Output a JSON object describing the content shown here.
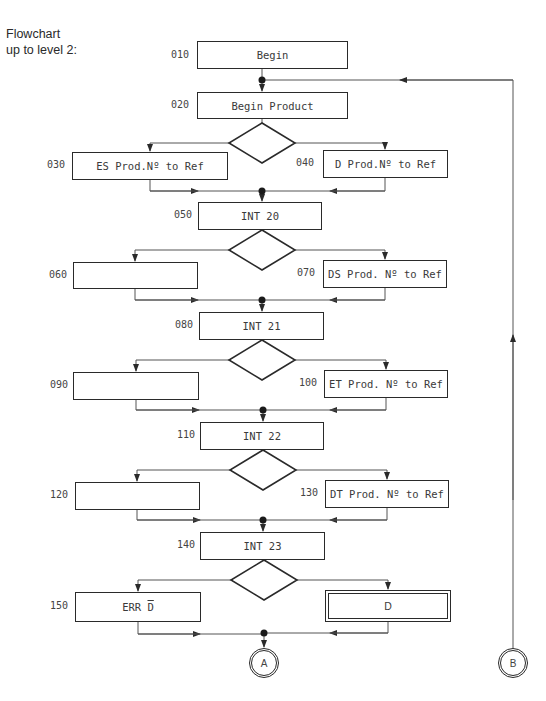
{
  "title": {
    "line1": "Flowchart",
    "line2": "up to level 2:"
  },
  "nodes": [
    {
      "id": "010",
      "label": "Begin"
    },
    {
      "id": "020",
      "label": "Begin Product"
    },
    {
      "id": "030",
      "label": "ES Prod.Nº to Ref"
    },
    {
      "id": "040",
      "label": "D Prod.Nº to Ref"
    },
    {
      "id": "050",
      "label": "INT 20"
    },
    {
      "id": "060",
      "label": ""
    },
    {
      "id": "070",
      "label": "DS Prod. Nº to Ref"
    },
    {
      "id": "080",
      "label": "INT 21"
    },
    {
      "id": "090",
      "label": ""
    },
    {
      "id": "100",
      "label": "ET Prod. Nº to Ref"
    },
    {
      "id": "110",
      "label": "INT 22"
    },
    {
      "id": "120",
      "label": ""
    },
    {
      "id": "130",
      "label": "DT Prod. Nº to Ref"
    },
    {
      "id": "140",
      "label": "INT 23"
    },
    {
      "id": "150",
      "label_prefix": "ERR ",
      "label_overline": "D"
    },
    {
      "id": "",
      "label": "D"
    }
  ],
  "connectors": {
    "a": "A",
    "b": "B"
  },
  "colors": {
    "line": "#2a2a2a",
    "background": "#ffffff"
  }
}
